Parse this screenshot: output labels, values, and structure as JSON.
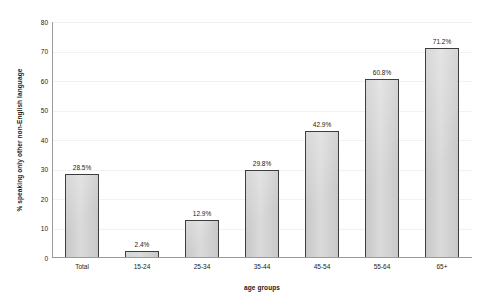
{
  "chart_data": {
    "type": "bar",
    "title": "",
    "subtitle": "",
    "xlabel": "age groups",
    "ylabel": "% speaking only other non-English language",
    "categories": [
      "Total",
      "15-24",
      "25-34",
      "35-44",
      "45-54",
      "55-64",
      "65+"
    ],
    "values": [
      28.5,
      2.4,
      12.9,
      29.8,
      42.9,
      60.8,
      71.2
    ],
    "data_labels": [
      "28.5%",
      "2.4%",
      "12.9%",
      "29.8%",
      "42.9%",
      "60.8%",
      "71.2%"
    ],
    "ylim": [
      0,
      80
    ],
    "ytick_values": [
      0,
      10,
      20,
      30,
      40,
      50,
      60,
      70,
      80
    ],
    "ytick_labels": [
      "0",
      "10",
      "20",
      "30",
      "40",
      "50",
      "60",
      "70",
      "80"
    ],
    "grid": true,
    "grid_axis": "y",
    "legend": false,
    "legend_position": "none",
    "bar_fill_color": "#d2d2d2",
    "bar_border_color": "#3d3d3d",
    "gridline_color": "#f2f2f4",
    "axis_color": "#9a9a9a",
    "text_color": "#1a1a1a",
    "background_color": "#ffffff"
  }
}
